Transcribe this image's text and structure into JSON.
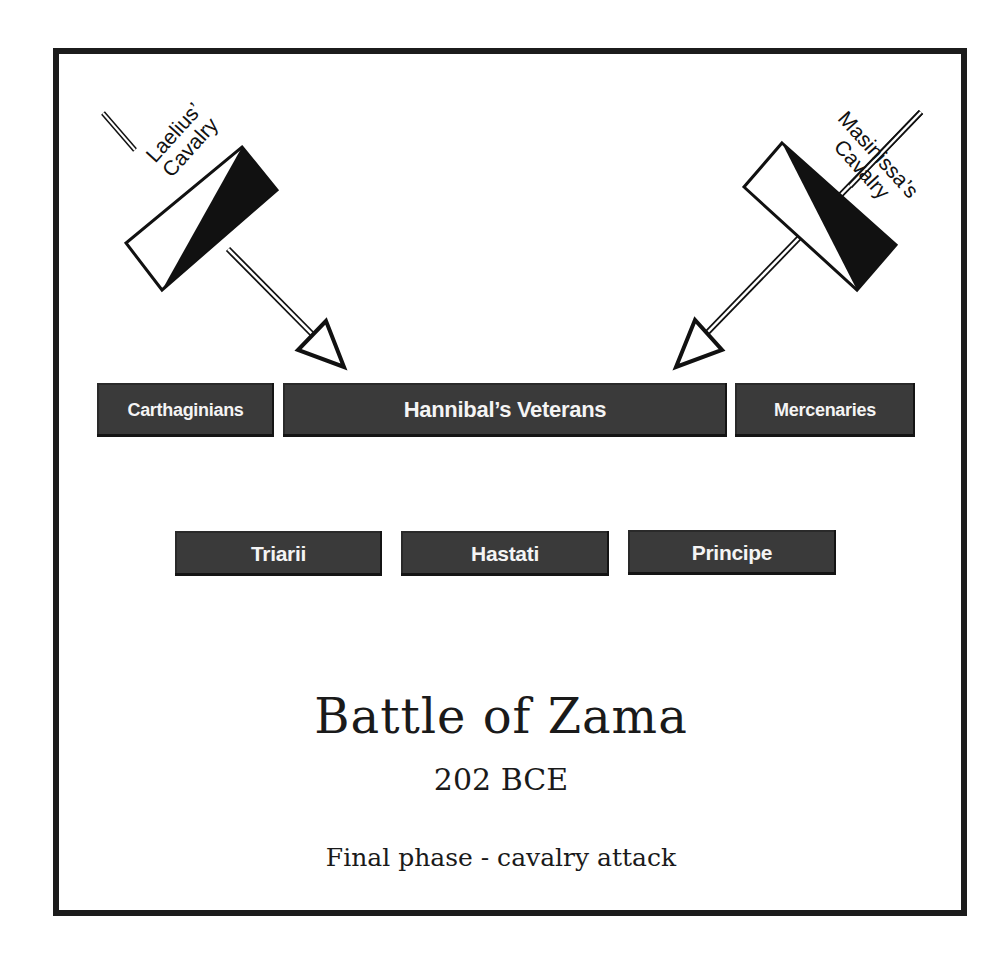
{
  "diagram": {
    "title": "Battle of Zama",
    "date": "202 BCE",
    "subtitle": "Final phase - cavalry attack",
    "carthaginian_line": [
      {
        "label": "Carthaginians"
      },
      {
        "label": "Hannibal’s Veterans"
      },
      {
        "label": "Mercenaries"
      }
    ],
    "roman_line": [
      {
        "label": "Triarii"
      },
      {
        "label": "Hastati"
      },
      {
        "label": "Principe"
      }
    ],
    "cavalry": [
      {
        "name_line1": "Laelius’",
        "name_line2": "Cavalry",
        "side": "left",
        "direction": "down-right"
      },
      {
        "name_line1": "Masinissa’s",
        "name_line2": "Cavalry",
        "side": "right",
        "direction": "down-left"
      }
    ],
    "colors": {
      "unit_fill": "#3a3a3a",
      "unit_text": "#f4f4f4",
      "frame": "#1c1c1c",
      "ink": "#111111"
    }
  }
}
